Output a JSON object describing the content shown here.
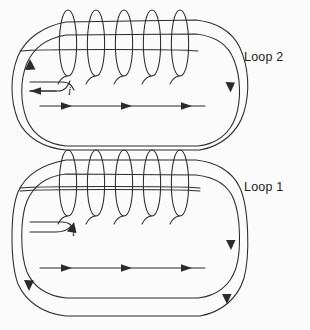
{
  "figure": {
    "type": "physics-circuit-diagram",
    "background_color": "#fbfbfb",
    "stroke_color": "#2b2b2b",
    "width": 310,
    "height": 330
  },
  "labels": {
    "loop2": "Loop 2",
    "loop1": "Loop 1",
    "current_upper": "i",
    "current_lower": "i"
  },
  "coils": [
    {
      "name": "upper-solenoid",
      "belongs_to": "Loop 2",
      "turns": 5,
      "axis_y": 40,
      "turn_centers_x": [
        68,
        96,
        124,
        152,
        180
      ],
      "turn_width": 21,
      "turn_height": 66
    },
    {
      "name": "lower-solenoid",
      "belongs_to": "Loop 1",
      "turns": 5,
      "axis_y": 180,
      "turn_centers_x": [
        68,
        96,
        124,
        152,
        180
      ],
      "turn_width": 21,
      "turn_height": 66
    }
  ],
  "circuit_loops": [
    {
      "name": "Loop 2",
      "description": "Upper rounded-rectangle circuit containing the upper solenoid",
      "current_direction": "clockwise",
      "arrow_count": 5
    },
    {
      "name": "Loop 1",
      "description": "Lower rounded-rectangle circuit containing the lower solenoid",
      "current_direction": "clockwise",
      "arrow_count": 5
    }
  ],
  "arrows": {
    "upper_loop_top_run": [
      65,
      125,
      185
    ],
    "upper_loop_left_up": 1,
    "lower_loop_bottom_run": [
      65,
      125,
      185
    ],
    "lower_loop_left_down": 1
  }
}
